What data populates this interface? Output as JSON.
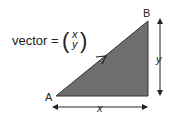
{
  "equation": {
    "lhs": "vector =",
    "top": "x",
    "bottom": "y"
  },
  "points": {
    "start": "A",
    "end": "B"
  },
  "dimensions": {
    "horizontal": "x",
    "vertical": "y"
  },
  "colors": {
    "fill": "#6e6e6e",
    "stroke": "#333333",
    "text": "#222222"
  }
}
